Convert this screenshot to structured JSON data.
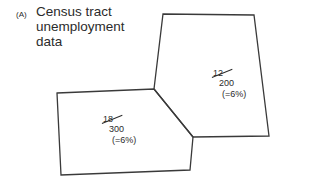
{
  "figure": {
    "panel_label": "(A)",
    "title_lines": [
      "Census tract",
      "unemployment",
      "data"
    ]
  },
  "tracts": [
    {
      "id": "left-tract",
      "numerator": "18",
      "denominator": "300",
      "rate": "(=6%)"
    },
    {
      "id": "right-tract",
      "numerator": "12",
      "denominator": "200",
      "rate": "(=6%)"
    }
  ],
  "colors": {
    "stroke": "#3a3a3a",
    "text": "#2b2b2b",
    "background": "#ffffff"
  }
}
